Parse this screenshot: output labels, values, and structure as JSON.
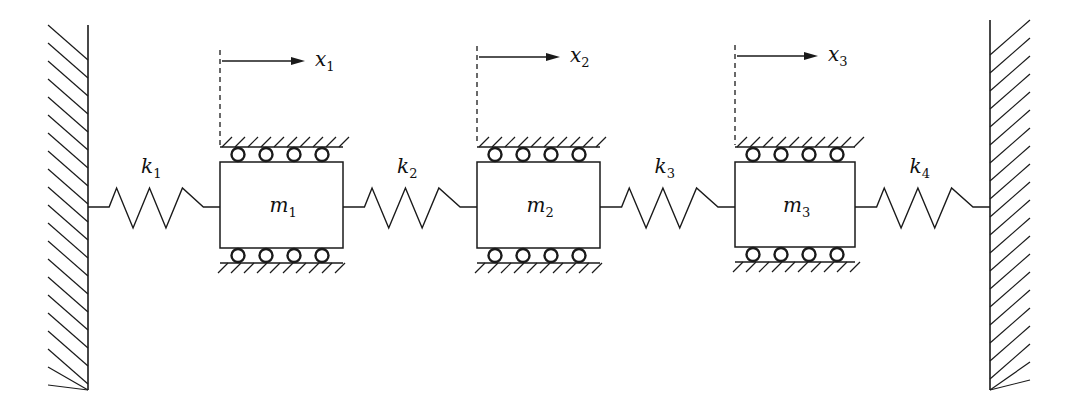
{
  "diagram": {
    "type": "three-mass spring system between fixed walls",
    "stroke_color": "#1a1a1a",
    "background": "#ffffff",
    "walls": [
      {
        "id": "left-wall",
        "x": 88,
        "y1": 25,
        "y2": 390,
        "hatch_side": "left"
      },
      {
        "id": "right-wall",
        "x": 990,
        "y1": 20,
        "y2": 390,
        "hatch_side": "right"
      }
    ],
    "masses": [
      {
        "id": "m1",
        "label": "m",
        "subscript": "1",
        "x": 220,
        "y": 162,
        "w": 123,
        "h": 86,
        "displacement": {
          "label": "x",
          "subscript": "1",
          "y": 61,
          "arrow_end": 305
        }
      },
      {
        "id": "m2",
        "label": "m",
        "subscript": "2",
        "x": 477,
        "y": 162,
        "w": 123,
        "h": 86,
        "displacement": {
          "label": "x",
          "subscript": "2",
          "y": 57,
          "arrow_end": 560
        }
      },
      {
        "id": "m3",
        "label": "m",
        "subscript": "3",
        "x": 735,
        "y": 162,
        "w": 120,
        "h": 85,
        "displacement": {
          "label": "x",
          "subscript": "3",
          "y": 56,
          "arrow_end": 818
        }
      }
    ],
    "springs": [
      {
        "id": "k1",
        "label": "k",
        "subscript": "1",
        "x1": 88,
        "x2": 220
      },
      {
        "id": "k2",
        "label": "k",
        "subscript": "2",
        "x1": 343,
        "x2": 477
      },
      {
        "id": "k3",
        "label": "k",
        "subscript": "3",
        "x1": 600,
        "x2": 735
      },
      {
        "id": "k4",
        "label": "k",
        "subscript": "4",
        "x1": 855,
        "x2": 990
      }
    ],
    "rollers_per_side": 4
  }
}
